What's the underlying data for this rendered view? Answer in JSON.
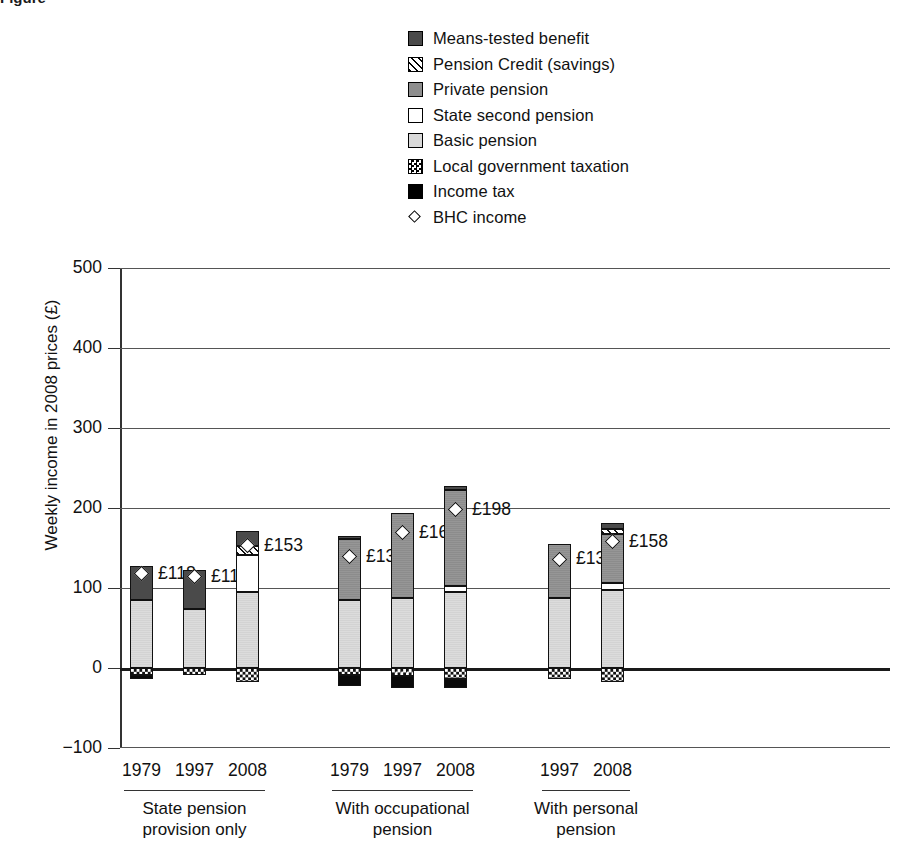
{
  "figure": {
    "caption_fragment": "Figure"
  },
  "legend": {
    "items": [
      {
        "label": "Means-tested benefit",
        "key": "means",
        "swatch": "dark-grey-square-icon"
      },
      {
        "label": "Pension Credit (savings)",
        "key": "pension_credit",
        "swatch": "hatched-square-icon"
      },
      {
        "label": "Private pension",
        "key": "private",
        "swatch": "grey-square-icon"
      },
      {
        "label": "State second pension",
        "key": "s2p",
        "swatch": "white-square-icon"
      },
      {
        "label": "Basic pension",
        "key": "basic",
        "swatch": "light-grey-square-icon"
      },
      {
        "label": "Local government taxation",
        "key": "local_tax",
        "swatch": "checkered-square-icon"
      },
      {
        "label": "Income tax",
        "key": "income_tax",
        "swatch": "black-square-icon"
      },
      {
        "label": "BHC income",
        "key": "bhc",
        "swatch": "diamond-marker-icon"
      }
    ]
  },
  "chart_data": {
    "type": "bar",
    "stacked": true,
    "title": "",
    "xlabel": "",
    "ylabel": "Weekly income in 2008 prices (£)",
    "ylim": [
      -100,
      500
    ],
    "yticks": [
      -100,
      0,
      100,
      200,
      300,
      400,
      500
    ],
    "ytick_labels": [
      "−100",
      "0",
      "100",
      "200",
      "300",
      "400",
      "500"
    ],
    "grid": true,
    "legend_position": "top",
    "colors": {
      "means": "#4a4a4a",
      "pension_credit": "#ffffff",
      "private": "#8e8e8e",
      "s2p": "#ffffff",
      "basic": "#d9d9d9",
      "local_tax": "#ffffff",
      "income_tax": "#000000",
      "bhc_marker": "#ffffff"
    },
    "groups": [
      {
        "name": "State pension provision only",
        "label_line1": "State pension",
        "label_line2": "provision only",
        "categories": [
          "1979",
          "1997",
          "2008"
        ],
        "bars": [
          {
            "year": "1979",
            "basic": 85,
            "s2p": 0,
            "private": 0,
            "pension_credit": 0,
            "means": 43,
            "local_tax": -9,
            "income_tax": -5,
            "bhc": 118,
            "bhc_label": "£118"
          },
          {
            "year": "1997",
            "basic": 74,
            "s2p": 0,
            "private": 0,
            "pension_credit": 0,
            "means": 48,
            "local_tax": -9,
            "income_tax": 0,
            "bhc": 114,
            "bhc_label": "£114"
          },
          {
            "year": "2008",
            "basic": 95,
            "s2p": 46,
            "private": 0,
            "pension_credit": 12,
            "means": 18,
            "local_tax": -18,
            "income_tax": 0,
            "bhc": 153,
            "bhc_label": "£153"
          }
        ]
      },
      {
        "name": "With occupational pension",
        "label_line1": "With occupational",
        "label_line2": "pension",
        "categories": [
          "1979",
          "1997",
          "2008"
        ],
        "bars": [
          {
            "year": "1979",
            "basic": 85,
            "s2p": 0,
            "private": 76,
            "pension_credit": 0,
            "means": 4,
            "local_tax": -9,
            "income_tax": -14,
            "bhc": 139,
            "bhc_label": "£139"
          },
          {
            "year": "1997",
            "basic": 88,
            "s2p": 0,
            "private": 106,
            "pension_credit": 0,
            "means": 0,
            "local_tax": -10,
            "income_tax": -15,
            "bhc": 169,
            "bhc_label": "£169"
          },
          {
            "year": "2008",
            "basic": 95,
            "s2p": 8,
            "private": 120,
            "pension_credit": 0,
            "means": 5,
            "local_tax": -14,
            "income_tax": -11,
            "bhc": 198,
            "bhc_label": "£198"
          }
        ]
      },
      {
        "name": "With personal pension",
        "label_line1": "With personal",
        "label_line2": "pension",
        "categories": [
          "1997",
          "2008"
        ],
        "bars": [
          {
            "year": "1997",
            "basic": 88,
            "s2p": 0,
            "private": 67,
            "pension_credit": 0,
            "means": 0,
            "local_tax": -14,
            "income_tax": 0,
            "bhc": 136,
            "bhc_label": "£136"
          },
          {
            "year": "2008",
            "basic": 97,
            "s2p": 9,
            "private": 62,
            "pension_credit": 6,
            "means": 7,
            "local_tax": -18,
            "income_tax": 0,
            "bhc": 158,
            "bhc_label": "£158"
          }
        ]
      }
    ]
  }
}
